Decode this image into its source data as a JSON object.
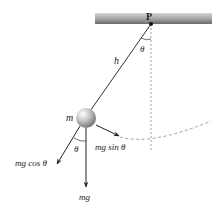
{
  "diagram": {
    "labels": {
      "pivot": "P",
      "length": "h",
      "mass": "m",
      "angle_top": "θ",
      "angle_bottom": "θ",
      "weight": "mg",
      "tangential": "mg sin θ",
      "radial": "mg cos θ"
    },
    "colors": {
      "ceiling_dark": "#6e6e6e",
      "ceiling_light": "#d8d8d8",
      "line": "#333333",
      "dashed": "#888888",
      "ball_light": "#f4f4f4",
      "ball_dark": "#8a8a8a"
    }
  }
}
